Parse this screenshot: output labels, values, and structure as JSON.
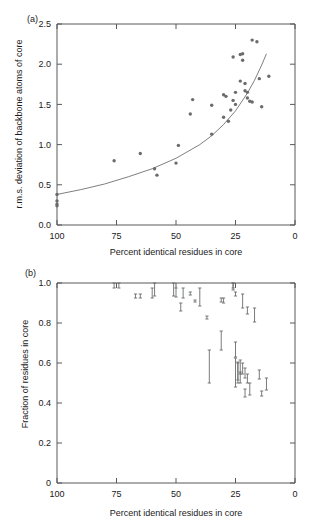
{
  "figure": {
    "panel_a_label": "(a)",
    "panel_b_label": "(b)"
  },
  "chart_data": [
    {
      "type": "scatter",
      "panel": "(a)",
      "title": "",
      "xlabel": "Percent identical residues in core",
      "ylabel": "r.m.s. deviation of backbone atoms of core",
      "xlim": [
        100,
        0
      ],
      "ylim": [
        0.0,
        2.5
      ],
      "x_reversed": true,
      "grid": false,
      "legend": null,
      "xticks": [
        100,
        75,
        50,
        25,
        0
      ],
      "xticklabels": [
        "100",
        "75",
        "50",
        "25",
        "0"
      ],
      "yticks": [
        0.0,
        0.5,
        1.0,
        1.5,
        2.0,
        2.5
      ],
      "yticklabels": [
        "0.0",
        "0.5",
        "1.0",
        "1.5",
        "2.0",
        "2.5"
      ],
      "points": [
        {
          "x": 100,
          "y": 0.38
        },
        {
          "x": 100,
          "y": 0.3
        },
        {
          "x": 100,
          "y": 0.26
        },
        {
          "x": 100,
          "y": 0.24
        },
        {
          "x": 76,
          "y": 0.8
        },
        {
          "x": 65,
          "y": 0.89
        },
        {
          "x": 59,
          "y": 0.7
        },
        {
          "x": 58,
          "y": 0.62
        },
        {
          "x": 50,
          "y": 0.77
        },
        {
          "x": 49,
          "y": 0.99
        },
        {
          "x": 44,
          "y": 1.38
        },
        {
          "x": 43,
          "y": 1.56
        },
        {
          "x": 35,
          "y": 1.13
        },
        {
          "x": 35,
          "y": 1.49
        },
        {
          "x": 30,
          "y": 1.34
        },
        {
          "x": 30,
          "y": 1.62
        },
        {
          "x": 29,
          "y": 1.6
        },
        {
          "x": 28,
          "y": 1.29
        },
        {
          "x": 27,
          "y": 1.43
        },
        {
          "x": 26,
          "y": 2.09
        },
        {
          "x": 26,
          "y": 1.55
        },
        {
          "x": 25,
          "y": 1.5
        },
        {
          "x": 25,
          "y": 1.65
        },
        {
          "x": 23,
          "y": 2.12
        },
        {
          "x": 23,
          "y": 1.79
        },
        {
          "x": 22,
          "y": 2.13
        },
        {
          "x": 22,
          "y": 2.05
        },
        {
          "x": 21,
          "y": 1.76
        },
        {
          "x": 21,
          "y": 1.67
        },
        {
          "x": 20,
          "y": 1.65
        },
        {
          "x": 20,
          "y": 1.58
        },
        {
          "x": 19,
          "y": 1.54
        },
        {
          "x": 18,
          "y": 2.3
        },
        {
          "x": 18,
          "y": 1.53
        },
        {
          "x": 16,
          "y": 2.28
        },
        {
          "x": 15,
          "y": 1.82
        },
        {
          "x": 14,
          "y": 1.47
        },
        {
          "x": 11,
          "y": 1.85
        }
      ],
      "fit_curve": {
        "label": "exponential fit",
        "formula_points": [
          {
            "x": 100,
            "y": 0.38
          },
          {
            "x": 90,
            "y": 0.44
          },
          {
            "x": 80,
            "y": 0.51
          },
          {
            "x": 70,
            "y": 0.6
          },
          {
            "x": 60,
            "y": 0.7
          },
          {
            "x": 50,
            "y": 0.83
          },
          {
            "x": 40,
            "y": 1.0
          },
          {
            "x": 35,
            "y": 1.11
          },
          {
            "x": 30,
            "y": 1.25
          },
          {
            "x": 25,
            "y": 1.42
          },
          {
            "x": 20,
            "y": 1.64
          },
          {
            "x": 17,
            "y": 1.8
          },
          {
            "x": 14,
            "y": 1.99
          },
          {
            "x": 12,
            "y": 2.13
          }
        ]
      }
    },
    {
      "type": "scatter",
      "panel": "(b)",
      "title": "",
      "xlabel": "Percent identical residues in core",
      "ylabel": "Fraction of residues in core",
      "xlim": [
        100,
        0
      ],
      "ylim": [
        0.0,
        1.0
      ],
      "x_reversed": true,
      "grid": false,
      "legend": null,
      "xticks": [
        100,
        75,
        50,
        25,
        0
      ],
      "xticklabels": [
        "100",
        "75",
        "50",
        "25",
        "0"
      ],
      "yticks": [
        0.0,
        0.2,
        0.4,
        0.6,
        0.8,
        1.0
      ],
      "yticklabels": [
        "0",
        "0.2",
        "0.4",
        "0.6",
        "0.8",
        "1.0"
      ],
      "error_bars": [
        {
          "x": 76,
          "low": 0.975,
          "high": 1.0
        },
        {
          "x": 74,
          "low": 0.975,
          "high": 1.0
        },
        {
          "x": 67,
          "low": 0.925,
          "high": 0.945
        },
        {
          "x": 65,
          "low": 0.925,
          "high": 0.945
        },
        {
          "x": 60,
          "low": 0.925,
          "high": 0.975
        },
        {
          "x": 59,
          "low": 0.935,
          "high": 1.0
        },
        {
          "x": 51,
          "low": 0.935,
          "high": 1.0
        },
        {
          "x": 50,
          "low": 0.93,
          "high": 0.975
        },
        {
          "x": 48,
          "low": 0.86,
          "high": 0.9
        },
        {
          "x": 47,
          "low": 0.925,
          "high": 0.975
        },
        {
          "x": 44,
          "low": 0.94,
          "high": 0.955
        },
        {
          "x": 42,
          "low": 0.905,
          "high": 0.915
        },
        {
          "x": 40,
          "low": 0.885,
          "high": 0.975
        },
        {
          "x": 37,
          "low": 0.82,
          "high": 0.835
        },
        {
          "x": 36,
          "low": 0.5,
          "high": 0.665
        },
        {
          "x": 31,
          "low": 0.665,
          "high": 0.76
        },
        {
          "x": 31,
          "low": 0.905,
          "high": 0.925
        },
        {
          "x": 30,
          "low": 0.9,
          "high": 0.925
        },
        {
          "x": 26,
          "low": 0.975,
          "high": 1.0
        },
        {
          "x": 26,
          "low": 0.965,
          "high": 1.0
        },
        {
          "x": 25,
          "low": 0.935,
          "high": 0.955
        },
        {
          "x": 25,
          "low": 0.63,
          "high": 0.705
        },
        {
          "x": 25,
          "low": 0.48,
          "high": 0.625
        },
        {
          "x": 24,
          "low": 0.515,
          "high": 0.6
        },
        {
          "x": 24,
          "low": 0.5,
          "high": 0.605
        },
        {
          "x": 23,
          "low": 0.545,
          "high": 0.615
        },
        {
          "x": 23,
          "low": 0.5,
          "high": 0.555
        },
        {
          "x": 22,
          "low": 0.875,
          "high": 0.945
        },
        {
          "x": 22,
          "low": 0.545,
          "high": 0.6
        },
        {
          "x": 21,
          "low": 0.525,
          "high": 0.575
        },
        {
          "x": 21,
          "low": 0.43,
          "high": 0.47
        },
        {
          "x": 20,
          "low": 0.845,
          "high": 0.88
        },
        {
          "x": 20,
          "low": 0.5,
          "high": 0.545
        },
        {
          "x": 19,
          "low": 0.44,
          "high": 0.5
        },
        {
          "x": 17,
          "low": 0.805,
          "high": 0.875
        },
        {
          "x": 15,
          "low": 0.52,
          "high": 0.565
        },
        {
          "x": 14,
          "low": 0.435,
          "high": 0.46
        },
        {
          "x": 12,
          "low": 0.465,
          "high": 0.525
        }
      ]
    }
  ]
}
